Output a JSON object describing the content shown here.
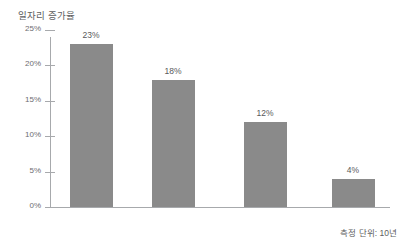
{
  "chart_data": {
    "type": "bar",
    "title": "일자리 증가율",
    "xlabel": "",
    "ylabel": "",
    "categories": [
      "1976~1985",
      "1986~1995",
      "1996~2005",
      "2006~2015"
    ],
    "values": [
      23,
      18,
      12,
      4
    ],
    "value_labels": [
      "23%",
      "18%",
      "12%",
      "4%"
    ],
    "ylim": [
      0,
      25
    ],
    "y_ticks": [
      0,
      5,
      10,
      15,
      20,
      25
    ],
    "y_tick_labels": [
      "0%",
      "5%",
      "10%",
      "15%",
      "20%",
      "25%"
    ],
    "grid": false,
    "legend": null,
    "annotations": [
      "측정 단위: 10년"
    ],
    "series": [
      {
        "name": "일자리 증가율",
        "values": [
          23,
          18,
          12,
          4
        ],
        "color": "#8a8a8a"
      }
    ]
  },
  "footnote": {
    "text": "측정 단위: 10년"
  },
  "colors": {
    "bar": "#8a8a8a",
    "axis": "#a7a9ac",
    "text": "#58595b",
    "background": "#ffffff"
  }
}
